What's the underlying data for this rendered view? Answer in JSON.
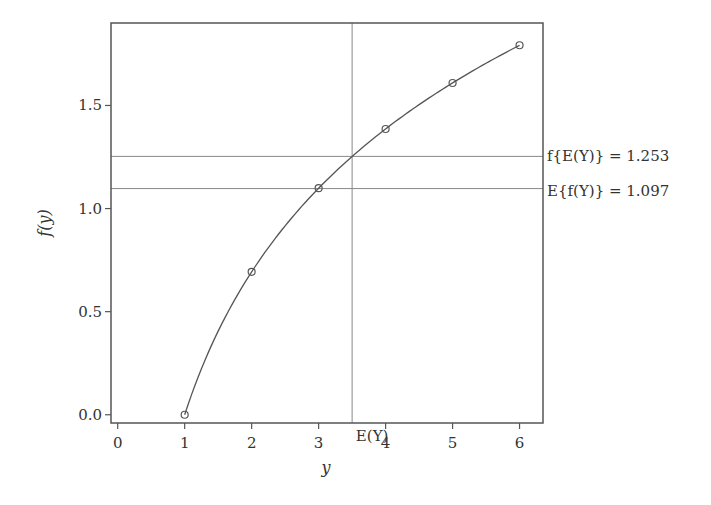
{
  "chart_data": {
    "type": "line",
    "title": "",
    "xlabel": "y",
    "ylabel": "f(y)",
    "xlim": [
      -0.1,
      6.35
    ],
    "ylim": [
      -0.04,
      1.9
    ],
    "grid": false,
    "x_ticks": [
      0,
      1,
      2,
      3,
      4,
      5,
      6
    ],
    "x_tick_labels": [
      "0",
      "1",
      "2",
      "3",
      "4",
      "5",
      "6"
    ],
    "y_ticks": [
      0.0,
      0.5,
      1.0,
      1.5
    ],
    "y_tick_labels": [
      "0.0",
      "0.5",
      "1.0",
      "1.5"
    ],
    "series": [
      {
        "name": "f(y) = ln(y)",
        "x": [
          1,
          2,
          3,
          4,
          5,
          6
        ],
        "y": [
          0.0,
          0.693,
          1.099,
          1.386,
          1.609,
          1.792
        ],
        "markers": "open-circle"
      }
    ],
    "reference_lines": {
      "vertical": [
        {
          "x": 3.5,
          "label": "E(Y)"
        }
      ],
      "horizontal": [
        {
          "y": 1.253,
          "label": "f{E(Y)} = 1.253"
        },
        {
          "y": 1.097,
          "label": "E{f(Y)} = 1.097"
        }
      ]
    },
    "colors": {
      "line": "#555555",
      "frame": "#555555",
      "reference": "#888888"
    }
  }
}
